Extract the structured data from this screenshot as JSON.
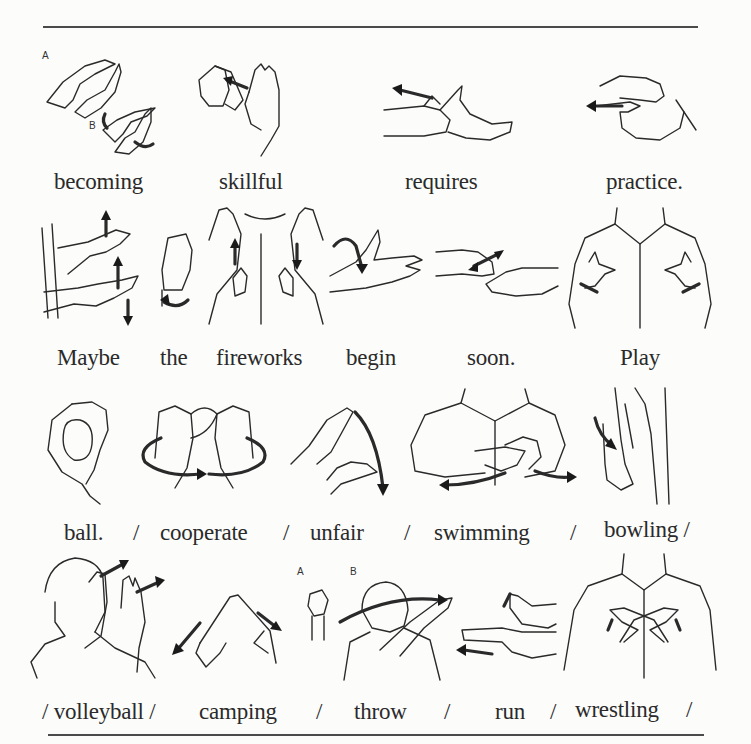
{
  "page": {
    "rules": {
      "top_y": 27,
      "bottom_y": 735
    },
    "rows": [
      {
        "words": [
          {
            "text": "becoming",
            "gloss": "becoming"
          },
          {
            "text": "skillful",
            "gloss": "skillful"
          },
          {
            "text": "requires",
            "gloss": "requires"
          },
          {
            "text": "practice.",
            "gloss": "practice"
          }
        ],
        "illustration_labels": [
          "A",
          "B"
        ]
      },
      {
        "words": [
          {
            "text": "Maybe",
            "gloss": "maybe"
          },
          {
            "text": "the",
            "gloss": "the"
          },
          {
            "text": "fireworks",
            "gloss": "fireworks"
          },
          {
            "text": "begin",
            "gloss": "begin"
          },
          {
            "text": "soon.",
            "gloss": "soon"
          },
          {
            "text": "Play",
            "gloss": "play"
          }
        ]
      },
      {
        "words": [
          {
            "text": "ball.",
            "gloss": "ball"
          },
          {
            "text": "/",
            "gloss": "separator"
          },
          {
            "text": "cooperate",
            "gloss": "cooperate"
          },
          {
            "text": "/",
            "gloss": "separator"
          },
          {
            "text": "unfair",
            "gloss": "unfair"
          },
          {
            "text": "/",
            "gloss": "separator"
          },
          {
            "text": "swimming",
            "gloss": "swimming"
          },
          {
            "text": "/",
            "gloss": "separator"
          },
          {
            "text": "bowling /",
            "gloss": "bowling"
          }
        ]
      },
      {
        "words": [
          {
            "text": "/ volleyball /",
            "gloss": "volleyball"
          },
          {
            "text": "camping",
            "gloss": "camping"
          },
          {
            "text": "/",
            "gloss": "separator"
          },
          {
            "text": "throw",
            "gloss": "throw"
          },
          {
            "text": "/",
            "gloss": "separator"
          },
          {
            "text": "run",
            "gloss": "run"
          },
          {
            "text": "/",
            "gloss": "separator"
          },
          {
            "text": "wrestling",
            "gloss": "wrestling"
          },
          {
            "text": "/",
            "gloss": "separator"
          }
        ],
        "illustration_labels": [
          "A",
          "B"
        ]
      }
    ]
  }
}
